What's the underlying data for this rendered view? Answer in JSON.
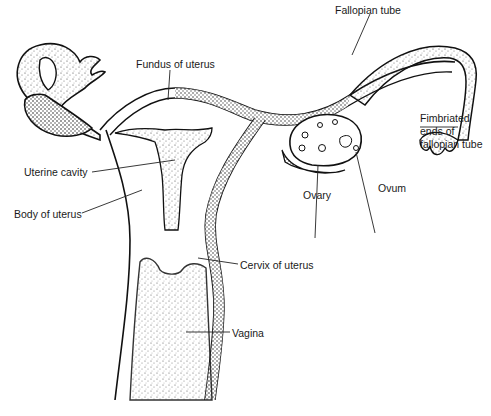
{
  "diagram": {
    "labels": {
      "fallopian_tube": "Fallopian tube",
      "fundus": "Fundus of uterus",
      "fimbriated_1": "Fimbriated",
      "fimbriated_2": "ends of",
      "fimbriated_3": "fallopian tube",
      "uterine_cavity": "Uterine cavity",
      "body_of_uterus": "Body of uterus",
      "ovary": "Ovary",
      "ovum": "Ovum",
      "cervix": "Cervix of uterus",
      "vagina": "Vagina"
    },
    "colors": {
      "ink": "#111111",
      "stipple": "#555555",
      "background": "#ffffff"
    }
  }
}
